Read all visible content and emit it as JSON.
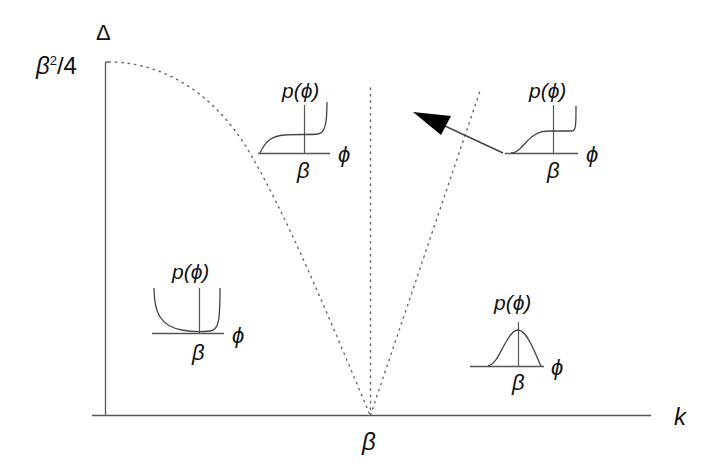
{
  "figure": {
    "type": "phase_diagram",
    "axes": {
      "y_label": "Δ",
      "y_max_label_base": "β",
      "y_max_label_sup": "2",
      "y_max_label_rest": "/4",
      "x_label": "k",
      "x_tick_label": "β"
    },
    "boundaries": [
      {
        "name": "parabola",
        "style": "dotted",
        "from": "Δ=β²/4 at k=0",
        "to": "Δ=0 at k=β"
      },
      {
        "name": "vertical",
        "style": "dotted",
        "at": "k=β"
      },
      {
        "name": "right-diagonal",
        "style": "dotted",
        "from": "k=β, Δ=0"
      }
    ],
    "insets": [
      {
        "id": "upper-middle",
        "region": "between parabola and vertical line",
        "p_label": "p(ϕ)",
        "phi_label": "ϕ",
        "beta_label": "β",
        "shape": "rises from left, plateau, sharp rise at right edge"
      },
      {
        "id": "upper-right",
        "region": "right of diagonal",
        "p_label": "p(ϕ)",
        "phi_label": "ϕ",
        "beta_label": "β",
        "shape": "sigmoid rise, plateau, sharp rise at right edge",
        "arrow": "points up-left toward diagonal boundary"
      },
      {
        "id": "lower-left",
        "region": "under parabola",
        "p_label": "p(ϕ)",
        "phi_label": "ϕ",
        "beta_label": "β",
        "shape": "U-shaped, diverging at both edges"
      },
      {
        "id": "lower-right",
        "region": "right of diagonal, low Δ",
        "p_label": "p(ϕ)",
        "phi_label": "ϕ",
        "beta_label": "β",
        "shape": "single peak centered at β"
      }
    ]
  },
  "colors": {
    "line": "#555555",
    "text": "#111111",
    "arrow": "#000000",
    "background": "#ffffff"
  }
}
